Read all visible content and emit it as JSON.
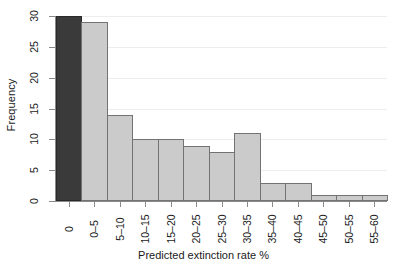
{
  "chart_data": {
    "type": "bar",
    "title": "",
    "subtitle": "",
    "xlabel": "Predicted extinction rate %",
    "ylabel": "Frequency",
    "categories": [
      "0",
      "0–5",
      "5–10",
      "10–15",
      "15–20",
      "20–25",
      "25–30",
      "30–35",
      "35–40",
      "40–45",
      "45–50",
      "50–55",
      "55–60"
    ],
    "values": [
      30,
      29,
      14,
      10,
      10,
      9,
      8,
      11,
      3,
      3,
      1,
      1,
      1
    ],
    "ylim": [
      0,
      30
    ],
    "yticks": [
      "0",
      "5",
      "10",
      "15",
      "20",
      "25",
      "30"
    ],
    "ytick_values": [
      0,
      5,
      10,
      15,
      20,
      25,
      30
    ],
    "grid": true,
    "grid_axis": "y",
    "legend": "none",
    "bar_colors": {
      "default": "#cbcbcb",
      "highlight": "#3a3a3a",
      "border": "#737373"
    },
    "highlight_index": 0,
    "axis_color": "#8a8a8a",
    "grid_color": "#ededed",
    "background": "#ffffff"
  }
}
